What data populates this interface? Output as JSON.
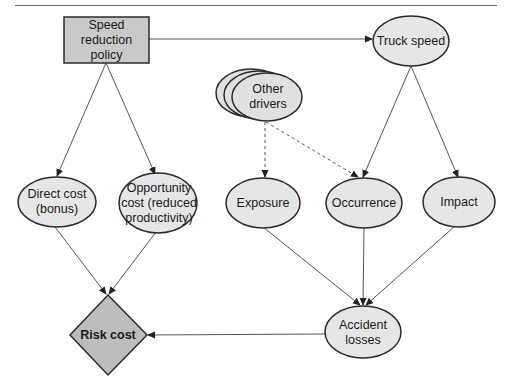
{
  "page_header": {
    "running_title": "Conclusions"
  },
  "colors": {
    "decision_fill": "#c9c9c9",
    "value_fill": "#bdbdbd",
    "chance_fill": "#e6e6e6",
    "stroke": "#2a2a2a",
    "edge": "#555555"
  },
  "nodes": {
    "speed_policy": {
      "label": "Speed reduction policy",
      "type": "decision"
    },
    "truck_speed": {
      "label": "Truck speed",
      "type": "chance"
    },
    "other_drivers": {
      "label": "Other drivers",
      "type": "chance-multiple"
    },
    "direct_cost": {
      "label": "Direct cost (bonus)",
      "type": "chance"
    },
    "opportunity_cost": {
      "label": "Opportunity cost (reduced productivity)",
      "type": "chance"
    },
    "exposure": {
      "label": "Exposure",
      "type": "chance"
    },
    "occurrence": {
      "label": "Occurrence",
      "type": "chance"
    },
    "impact": {
      "label": "Impact",
      "type": "chance"
    },
    "accident_losses": {
      "label": "Accident losses",
      "type": "chance"
    },
    "risk_cost": {
      "label": "Risk cost",
      "type": "value"
    }
  },
  "edges": [
    {
      "from": "speed_policy",
      "to": "truck_speed",
      "style": "solid"
    },
    {
      "from": "speed_policy",
      "to": "direct_cost",
      "style": "solid"
    },
    {
      "from": "speed_policy",
      "to": "opportunity_cost",
      "style": "solid"
    },
    {
      "from": "other_drivers",
      "to": "exposure",
      "style": "dashed"
    },
    {
      "from": "other_drivers",
      "to": "occurrence",
      "style": "dashed"
    },
    {
      "from": "truck_speed",
      "to": "occurrence",
      "style": "solid"
    },
    {
      "from": "truck_speed",
      "to": "impact",
      "style": "solid"
    },
    {
      "from": "direct_cost",
      "to": "risk_cost",
      "style": "solid"
    },
    {
      "from": "opportunity_cost",
      "to": "risk_cost",
      "style": "solid"
    },
    {
      "from": "exposure",
      "to": "accident_losses",
      "style": "solid"
    },
    {
      "from": "occurrence",
      "to": "accident_losses",
      "style": "solid"
    },
    {
      "from": "impact",
      "to": "accident_losses",
      "style": "solid"
    },
    {
      "from": "accident_losses",
      "to": "risk_cost",
      "style": "solid"
    }
  ]
}
